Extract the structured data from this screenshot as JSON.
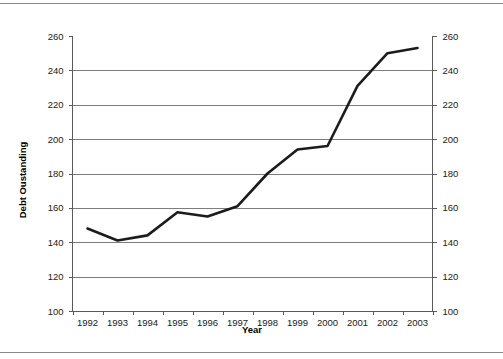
{
  "chart_data": {
    "type": "line",
    "title": "",
    "xlabel": "Year",
    "ylabel": "Debt Oustanding",
    "x": [
      1992,
      1993,
      1994,
      1995,
      1996,
      1997,
      1998,
      1999,
      2000,
      2001,
      2002,
      2003
    ],
    "categories": [
      "1992",
      "1993",
      "1994",
      "1995",
      "1996",
      "1997",
      "1998",
      "1999",
      "2000",
      "2001",
      "2002",
      "2003"
    ],
    "values": [
      148,
      141,
      144,
      157.5,
      155,
      161,
      180,
      194,
      196,
      231,
      250,
      253
    ],
    "series": [
      {
        "name": "Debt Oustanding",
        "values": [
          148,
          141,
          144,
          157.5,
          155,
          161,
          180,
          194,
          196,
          231,
          250,
          253
        ]
      }
    ],
    "ylim": [
      100,
      260
    ],
    "ytick_labels": [
      "260",
      "240",
      "220",
      "200",
      "180",
      "160",
      "140",
      "120",
      "100"
    ],
    "ytick_values": [
      260,
      240,
      220,
      200,
      180,
      160,
      140,
      120,
      100
    ],
    "right_axis": {
      "visible": true,
      "tick_labels": [
        "260",
        "240",
        "220",
        "200",
        "180",
        "160",
        "140",
        "120",
        "100"
      ],
      "tick_values": [
        260,
        240,
        220,
        200,
        180,
        160,
        140,
        120,
        100
      ]
    },
    "xtick_labels": [
      "1992",
      "1993",
      "1994",
      "1995",
      "1996",
      "1997",
      "1998",
      "1999",
      "2000",
      "2001",
      "2002",
      "2003"
    ],
    "grid": {
      "horizontal": true,
      "vertical": false
    },
    "legend": {
      "visible": false,
      "position": "none"
    },
    "colors": {
      "line": "#1c1c1c",
      "gridline": "#7d7d7d",
      "axis": "#5a5a5a",
      "text": "#1a1a1a",
      "background": "#ffffff"
    }
  },
  "axis_titles": {
    "y": "Debt Oustanding",
    "x": "Year"
  }
}
